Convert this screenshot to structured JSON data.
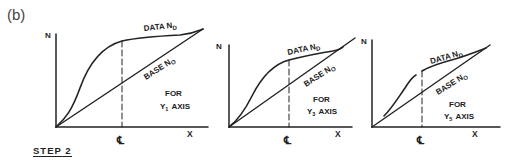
{
  "figure": {
    "label": "(b)",
    "step_label": "STEP 2",
    "common": {
      "y_axis_label": "N",
      "x_axis_label": "X",
      "centerline_label": "℄",
      "data_curve_label": "DATA N",
      "data_curve_subscript": "D",
      "base_curve_label": "BASE N",
      "base_curve_subscript": "O"
    },
    "panels": [
      {
        "id": "panel-1",
        "caption_line1": "FOR",
        "caption_line2_prefix": "Y",
        "caption_sub": "1",
        "caption_line2_suffix": "AXIS"
      },
      {
        "id": "panel-2",
        "caption_line1": "FOR",
        "caption_line2_prefix": "Y",
        "caption_sub": "3",
        "caption_line2_suffix": "AXIS"
      },
      {
        "id": "panel-3",
        "caption_line1": "FOR",
        "caption_line2_prefix": "Y",
        "caption_sub": "5",
        "caption_line2_suffix": "AXIS"
      }
    ]
  }
}
